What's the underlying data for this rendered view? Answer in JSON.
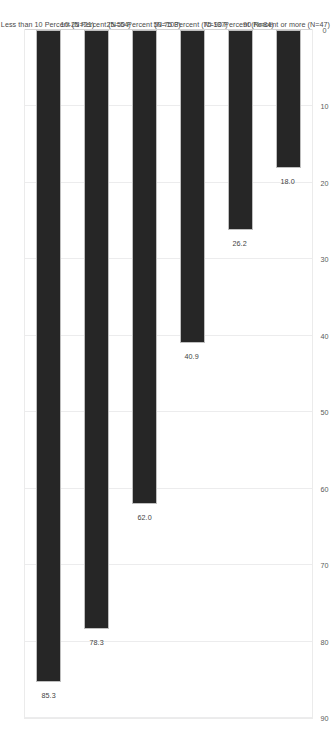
{
  "chart_data": {
    "type": "bar",
    "orientation": "horizontal",
    "title": "",
    "subtitle": "",
    "xlabel": "",
    "ylabel": "",
    "ylim": [
      0,
      90
    ],
    "grid": true,
    "legend": false,
    "legend_position": "none",
    "tick_labels": [
      "90",
      "80",
      "70",
      "60",
      "50",
      "40",
      "30",
      "20",
      "10",
      "0"
    ],
    "tick_values": [
      90,
      80,
      70,
      60,
      50,
      40,
      30,
      20,
      10,
      0
    ],
    "categories": [
      "Less than 10 Percent (N=21)",
      "10-25 Percent (N=54)",
      "25-50 Percent (N=103)",
      "50-75 Percent (N=137)",
      "75-90 Percent (N=84)",
      "90 Percent or more (N=47)"
    ],
    "values": [
      85.3,
      78.3,
      62.0,
      40.9,
      26.2,
      18.0
    ],
    "data_labels": [
      "85.3",
      "78.3",
      "62.0",
      "40.9",
      "26.2",
      "18.0"
    ],
    "bar_color": "#262626",
    "bar_border_color": "#bfbfbf",
    "gridline_color": "#ececed",
    "frame_color": "#ebebeb",
    "label_color": "#4a4a4a",
    "background_color": "#ffffff"
  }
}
